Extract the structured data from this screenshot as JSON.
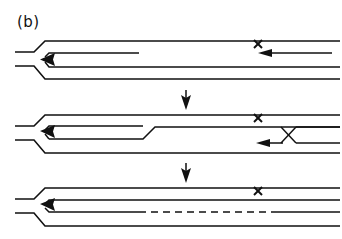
{
  "figure": {
    "panel_label": "(b)",
    "width": 342,
    "height": 239,
    "background_color": "#ffffff",
    "line_color": "#111111",
    "stage_count": 3,
    "transition_arrow_count": 2
  },
  "stages": [
    {
      "index": 1,
      "name": "stage-initial",
      "y_center": 60,
      "markers": [
        {
          "name": "x-marker",
          "symbol": "x",
          "x": 258,
          "y": 44
        }
      ],
      "arrowheads": [
        {
          "name": "left-arrowhead",
          "direction": "left",
          "x": 43,
          "y": 59
        },
        {
          "name": "right-arrowhead",
          "direction": "left",
          "x": 262,
          "y": 53
        }
      ],
      "inner_line_end_x": 139,
      "features": [
        "fork-junction",
        "upper-rail",
        "lower-rail",
        "truncated-inner-line"
      ]
    },
    {
      "index": 2,
      "name": "stage-middle",
      "y_center": 137,
      "markers": [
        {
          "name": "x-marker",
          "symbol": "x",
          "x": 258,
          "y": 118
        }
      ],
      "arrowheads": [
        {
          "name": "left-arrowhead",
          "direction": "left",
          "x": 43,
          "y": 131
        },
        {
          "name": "right-arrowhead",
          "direction": "left",
          "x": 258,
          "y": 143
        }
      ],
      "kink_x": 143,
      "crossing_x": 288,
      "features": [
        "fork-junction",
        "elongated-loop",
        "kink-step",
        "x-crossing"
      ]
    },
    {
      "index": 3,
      "name": "stage-final",
      "y_center": 210,
      "markers": [
        {
          "name": "x-marker",
          "symbol": "x",
          "x": 258,
          "y": 191
        }
      ],
      "arrowheads": [
        {
          "name": "left-arrowhead",
          "direction": "left",
          "x": 43,
          "y": 204
        }
      ],
      "dashed_segment": {
        "start_x": 139,
        "end_x": 276
      },
      "features": [
        "fork-junction",
        "full-length-loop",
        "dashed-segment"
      ]
    }
  ],
  "transition_arrows": [
    {
      "name": "transition-arrow-1",
      "direction": "down",
      "x": 186,
      "y_top": 90,
      "y_bottom": 110
    },
    {
      "name": "transition-arrow-2",
      "direction": "down",
      "x": 186,
      "y_top": 163,
      "y_bottom": 183
    }
  ]
}
